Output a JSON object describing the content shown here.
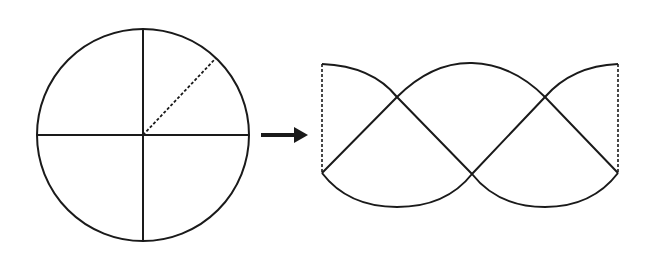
{
  "diagram": {
    "stroke_color": "#1a1a1a",
    "background": "#ffffff",
    "circle": {
      "cx": 143,
      "cy": 135,
      "r": 106,
      "dashed_radius_end": [
        216,
        58
      ]
    },
    "arrow": {
      "x1": 261,
      "x2": 308,
      "y": 135
    },
    "unrolled": {
      "left_x": 322,
      "right_x": 618,
      "top_y": 64,
      "bottom_y": 173,
      "crossings": [
        [
          397,
          97
        ],
        [
          472,
          174
        ],
        [
          545,
          97
        ]
      ]
    }
  }
}
